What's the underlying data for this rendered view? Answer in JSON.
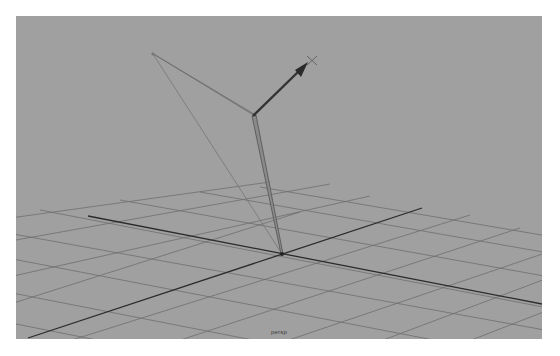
{
  "viewport": {
    "camera_label": "persp",
    "background_color": "#a0a0a0",
    "grid_color": "#6e6e6e",
    "axis_color": "#2b2b2b"
  },
  "scene": {
    "origin": [
      282,
      254
    ],
    "joints": [
      {
        "name": "root",
        "pos": [
          282,
          254
        ]
      },
      {
        "name": "mid",
        "pos": [
          254,
          115
        ]
      },
      {
        "name": "end",
        "pos": [
          153,
          54
        ]
      }
    ],
    "pole_vector_arrow": {
      "from": [
        254,
        115
      ],
      "to": [
        306,
        64
      ],
      "locator": [
        312,
        60
      ]
    }
  }
}
